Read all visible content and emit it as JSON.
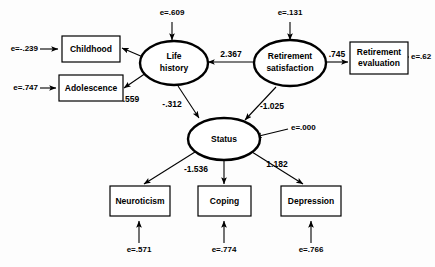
{
  "diagram": {
    "type": "structural-equation-model-path-diagram",
    "latent_variables": [
      {
        "id": "life_history",
        "label_line1": "Life",
        "label_line2": "history",
        "shape": "ellipse"
      },
      {
        "id": "retirement_satisfaction",
        "label_line1": "Retirement",
        "label_line2": "satisfaction",
        "shape": "ellipse"
      },
      {
        "id": "status",
        "label_line1": "Status",
        "label_line2": "",
        "shape": "ellipse"
      }
    ],
    "observed_variables": [
      {
        "id": "childhood",
        "label": "Childhood",
        "shape": "rectangle"
      },
      {
        "id": "adolescence",
        "label": "Adolescence",
        "shape": "rectangle"
      },
      {
        "id": "retirement_evaluation",
        "label_line1": "Retirement",
        "label_line2": "evaluation",
        "shape": "rectangle"
      },
      {
        "id": "neuroticism",
        "label": "Neuroticism",
        "shape": "rectangle"
      },
      {
        "id": "coping",
        "label": "Coping",
        "shape": "rectangle"
      },
      {
        "id": "depression",
        "label": "Depression",
        "shape": "rectangle"
      }
    ],
    "path_coefficients": [
      {
        "id": "life_to_adolescence",
        "from": "life_history",
        "to": "adolescence",
        "value": ".559"
      },
      {
        "id": "retsat_to_life",
        "from": "retirement_satisfaction",
        "to": "life_history",
        "value": "2.367"
      },
      {
        "id": "retsat_to_reteval",
        "from": "retirement_satisfaction",
        "to": "retirement_evaluation",
        "value": ".745"
      },
      {
        "id": "life_to_status",
        "from": "life_history",
        "to": "status",
        "value": "-.312"
      },
      {
        "id": "retsat_to_status",
        "from": "retirement_satisfaction",
        "to": "status",
        "value": "-1.025"
      },
      {
        "id": "status_to_neuroticism",
        "from": "status",
        "to": "neuroticism",
        "value": "-1.536"
      },
      {
        "id": "status_to_depression",
        "from": "status",
        "to": "depression",
        "value": "1.182"
      }
    ],
    "error_terms": [
      {
        "id": "err_childhood",
        "target": "childhood",
        "label": "e=-.239"
      },
      {
        "id": "err_adolescence",
        "target": "adolescence",
        "label": "e=.747"
      },
      {
        "id": "err_life_history",
        "target": "life_history",
        "label": "e=.609"
      },
      {
        "id": "err_retirement_satisfaction",
        "target": "retirement_satisfaction",
        "label": "e=.131"
      },
      {
        "id": "err_retirement_evaluation",
        "target": "retirement_evaluation",
        "label": "e=.62"
      },
      {
        "id": "err_status",
        "target": "status",
        "label": "e=.000"
      },
      {
        "id": "err_neuroticism",
        "target": "neuroticism",
        "label": "e=.571"
      },
      {
        "id": "err_coping",
        "target": "coping",
        "label": "e=.774"
      },
      {
        "id": "err_depression",
        "target": "depression",
        "label": "e=.766"
      }
    ],
    "colors": {
      "background": "#fdfdfd",
      "stroke": "#000000",
      "node_fill": "#ffffff"
    }
  }
}
